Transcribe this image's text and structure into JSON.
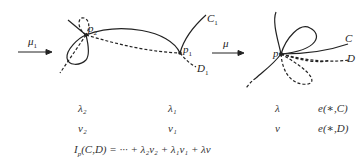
{
  "figure": {
    "arrows": [
      {
        "label": "μ",
        "sub": "1"
      },
      {
        "label": "μ",
        "sub": ""
      }
    ],
    "left": {
      "point_label": "p",
      "point_sub": "2"
    },
    "middle": {
      "point_label": "p",
      "point_sub": "1",
      "curve_c_label": "C",
      "curve_c_sub": "1",
      "curve_d_label": "D",
      "curve_d_sub": "1"
    },
    "right": {
      "point_label": "p",
      "curve_c_label": "C",
      "curve_d_label": "D"
    }
  },
  "table": {
    "row1": [
      "λ₂",
      "λ₁",
      "λ",
      "e(∗,C)"
    ],
    "row2": [
      "ν₂",
      "ν₁",
      "ν",
      "e(∗,D)"
    ]
  },
  "formula": "I_p(C,D) = ··· + λ₂ν₂ + λ₁ν₁ + λν",
  "formula_parts": {
    "lhs_main": "I",
    "lhs_sub": "p",
    "lhs_args": "(C,D) = ··· + λ₂ν₂ + λ₁ν₁ + λν"
  }
}
